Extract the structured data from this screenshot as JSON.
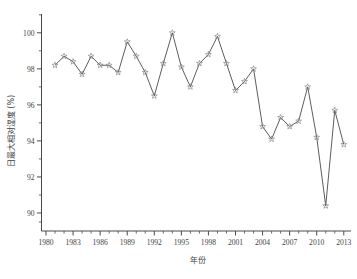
{
  "chart_data": {
    "type": "line",
    "title": "",
    "xlabel": "年份",
    "ylabel": "日最大相对湿度 (%)",
    "xlim": [
      1979.5,
      2013.8
    ],
    "ylim": [
      89.0,
      100.6
    ],
    "grid": false,
    "legend": null,
    "marker": "open-star",
    "line_color": "#4b4b4b",
    "marker_color": "#8a8a8a",
    "x_tick_labels": [
      "1980",
      "1983",
      "1986",
      "1989",
      "1992",
      "1995",
      "1998",
      "2001",
      "2004",
      "2007",
      "2010",
      "2013"
    ],
    "x_tick_values": [
      1980,
      1983,
      1986,
      1989,
      1992,
      1995,
      1998,
      2001,
      2004,
      2007,
      2010,
      2013
    ],
    "y_tick_labels": [
      "90",
      "92",
      "94",
      "96",
      "98",
      "100"
    ],
    "y_tick_values": [
      90,
      92,
      94,
      96,
      98,
      100
    ],
    "x": [
      1981,
      1982,
      1983,
      1984,
      1985,
      1986,
      1987,
      1988,
      1989,
      1990,
      1991,
      1992,
      1993,
      1994,
      1995,
      1996,
      1997,
      1998,
      1999,
      2000,
      2001,
      2002,
      2003,
      2004,
      2005,
      2006,
      2007,
      2008,
      2009,
      2010,
      2011,
      2012,
      2013
    ],
    "values": [
      98.2,
      98.7,
      98.4,
      97.7,
      98.7,
      98.2,
      98.2,
      97.8,
      99.5,
      98.7,
      97.8,
      96.5,
      98.3,
      100.0,
      98.1,
      97.0,
      98.3,
      98.8,
      99.8,
      98.3,
      96.8,
      97.3,
      98.0,
      94.8,
      94.1,
      95.3,
      94.8,
      95.1,
      97.0,
      94.2,
      90.4,
      95.7,
      93.8
    ],
    "series": [
      {
        "name": "日最大相对湿度",
        "values": [
          98.2,
          98.7,
          98.4,
          97.7,
          98.7,
          98.2,
          98.2,
          97.8,
          99.5,
          98.7,
          97.8,
          96.5,
          98.3,
          100.0,
          98.1,
          97.0,
          98.3,
          98.8,
          99.8,
          98.3,
          96.8,
          97.3,
          98.0,
          94.8,
          94.1,
          95.3,
          94.8,
          95.1,
          97.0,
          94.2,
          90.4,
          95.7,
          93.8
        ]
      }
    ]
  }
}
